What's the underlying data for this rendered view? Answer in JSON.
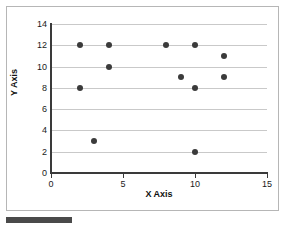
{
  "chart_data": {
    "type": "scatter",
    "title": "",
    "xlabel": "X Axis",
    "ylabel": "Y Axis",
    "xlim": [
      0,
      15
    ],
    "ylim": [
      0,
      14
    ],
    "xticks": [
      0,
      5,
      10,
      15
    ],
    "yticks": [
      0,
      2,
      4,
      6,
      8,
      10,
      12,
      14
    ],
    "xtick_labels": [
      "0",
      "5",
      "10",
      "15"
    ],
    "ytick_labels": [
      "0",
      "2",
      "4",
      "6",
      "8",
      "10",
      "12",
      "14"
    ],
    "grid": "horizontal",
    "legend": "none",
    "marker_color": "#3b3b3b",
    "points": [
      {
        "x": 2,
        "y": 12
      },
      {
        "x": 4,
        "y": 12
      },
      {
        "x": 8,
        "y": 12
      },
      {
        "x": 10,
        "y": 12
      },
      {
        "x": 12,
        "y": 11
      },
      {
        "x": 4,
        "y": 10
      },
      {
        "x": 9,
        "y": 9
      },
      {
        "x": 12,
        "y": 9
      },
      {
        "x": 2,
        "y": 8
      },
      {
        "x": 10,
        "y": 8
      },
      {
        "x": 3,
        "y": 3
      },
      {
        "x": 10,
        "y": 2
      }
    ]
  },
  "decoration": {
    "bottom_bar_color": "#4a4a4a",
    "card_border_color": "#b6b6b6"
  }
}
